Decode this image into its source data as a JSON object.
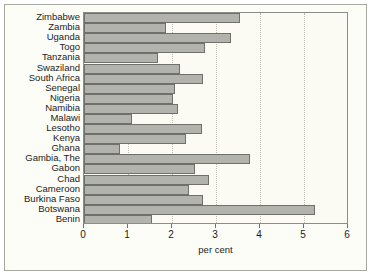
{
  "chart_data": {
    "type": "bar",
    "orientation": "horizontal",
    "title": "",
    "xlabel": "per cent",
    "ylabel": "",
    "xlim": [
      0,
      6
    ],
    "xticks": [
      "0",
      "1",
      "2",
      "3",
      "4",
      "5",
      "6"
    ],
    "grid": "vertical-dotted",
    "legend": "none",
    "categories": [
      "Zimbabwe",
      "Zambia",
      "Uganda",
      "Togo",
      "Tanzania",
      "Swaziland",
      "South Africa",
      "Senegal",
      "Nigeria",
      "Namibia",
      "Malawi",
      "Lesotho",
      "Kenya",
      "Ghana",
      "Gambia, The",
      "Gabon",
      "Chad",
      "Cameroon",
      "Burkina Faso",
      "Botswana",
      "Benin"
    ],
    "values": [
      3.55,
      1.86,
      3.33,
      2.75,
      1.68,
      2.18,
      2.7,
      2.07,
      2.02,
      2.14,
      1.08,
      2.68,
      2.32,
      0.81,
      3.78,
      2.53,
      2.85,
      2.38,
      2.7,
      5.25,
      1.55
    ],
    "bar_color": "#b3b3ae",
    "bar_border_color": "#6f6f6b",
    "plot_background": "#fbfbf4",
    "figure_background": "#fdfdf8",
    "frame_color": "#a9a9a4",
    "axis_color": "#6f6f6b",
    "grid_color": "#b9b9b0",
    "text_color": "#1b1b1b"
  }
}
